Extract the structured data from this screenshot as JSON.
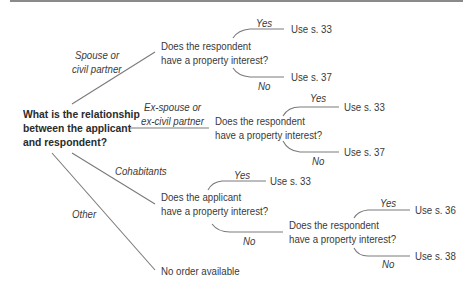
{
  "diagram": {
    "root_question": {
      "lines": [
        "What is the relationship",
        "between the applicant",
        "and respondent?"
      ]
    },
    "branches": [
      {
        "id": "spouse",
        "label_lines": [
          "Spouse or",
          "civil partner"
        ],
        "question_lines": [
          "Does the respondent",
          "have a property interest?"
        ],
        "yes": {
          "label": "Yes",
          "outcome": "Use s. 33"
        },
        "no": {
          "label": "No",
          "outcome": "Use s. 37"
        }
      },
      {
        "id": "ex-spouse",
        "label_lines": [
          "Ex-spouse or",
          "ex-civil partner"
        ],
        "question_lines": [
          "Does the respondent",
          "have a property interest?"
        ],
        "yes": {
          "label": "Yes",
          "outcome": "Use s. 33"
        },
        "no": {
          "label": "No",
          "outcome": "Use s. 37"
        }
      },
      {
        "id": "cohabitants",
        "label_lines": [
          "Cohabitants"
        ],
        "question_lines": [
          "Does the applicant",
          "have a property interest?"
        ],
        "yes": {
          "label": "Yes",
          "outcome": "Use s. 33"
        },
        "no": {
          "label": "No",
          "question_lines": [
            "Does the respondent",
            "have a property interest?"
          ],
          "yes": {
            "label": "Yes",
            "outcome": "Use s. 36"
          },
          "no": {
            "label": "No",
            "outcome": "Use s. 38"
          }
        }
      },
      {
        "id": "other",
        "label_lines": [
          "Other"
        ],
        "outcome": "No order available"
      }
    ]
  }
}
